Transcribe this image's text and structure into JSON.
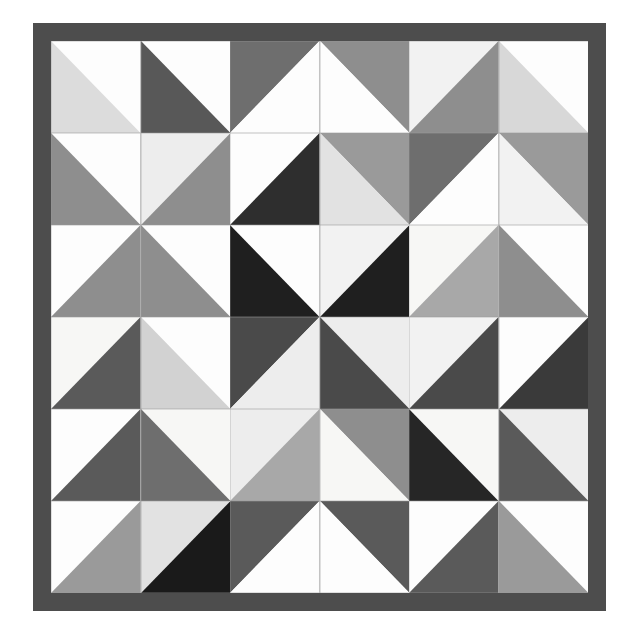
{
  "artwork": {
    "name": "half-square-triangle-quilt",
    "type": "geometric-quilt-pattern",
    "canvas_width": 636,
    "canvas_height": 644,
    "background_color": "#ffffff"
  },
  "frame": {
    "name": "quilt-border",
    "border_color": "#4d4d4d",
    "border_width": 18,
    "left": 33,
    "top": 23,
    "width": 573,
    "height": 588
  },
  "grid": {
    "rows": 6,
    "cols": 6,
    "cell_width": 92.5,
    "cell_height": 95.0,
    "seam_color": "#9c9c9c",
    "seam_width": 0.8
  },
  "palette": {
    "white": "#fdfdfd",
    "offwhite": "#f7f7f5",
    "lightest": "#eeeeee",
    "light": "#e2e2e2",
    "light_gray": "#d8d8d8",
    "mid_light": "#c4c4c4",
    "mid": "#a8a8a8",
    "mid_gray": "#9a9a9a",
    "steel": "#8e8e8e",
    "dark_gray": "#6e6e6e",
    "dark": "#5a5a5a",
    "darker": "#4a4a4a",
    "charcoal": "#3a3a3a",
    "near_black": "#262626",
    "black": "#1a1a1a"
  },
  "chart_data": {
    "type": "heatmap",
    "rows": 6,
    "cols": 6,
    "diagonal_legend": {
      "nwse": "diagonal runs from top-left corner to bottom-right corner; triangle A is upper-right, triangle B is lower-left",
      "nesw": "diagonal runs from top-right corner to bottom-left corner; triangle A is upper-left, triangle B is lower-right"
    },
    "cells": [
      [
        {
          "r": 1,
          "c": 1,
          "diag": "nwse",
          "a": "#fdfdfd",
          "b": "#dcdcdc"
        },
        {
          "r": 1,
          "c": 2,
          "diag": "nwse",
          "a": "#fdfdfd",
          "b": "#585858"
        },
        {
          "r": 1,
          "c": 3,
          "diag": "nesw",
          "a": "#6e6e6e",
          "b": "#fdfdfd"
        },
        {
          "r": 1,
          "c": 4,
          "diag": "nwse",
          "a": "#8e8e8e",
          "b": "#fdfdfd"
        },
        {
          "r": 1,
          "c": 5,
          "diag": "nesw",
          "a": "#f2f2f2",
          "b": "#8e8e8e"
        },
        {
          "r": 1,
          "c": 6,
          "diag": "nwse",
          "a": "#fdfdfd",
          "b": "#d8d8d8"
        }
      ],
      [
        {
          "r": 2,
          "c": 1,
          "diag": "nwse",
          "a": "#fdfdfd",
          "b": "#8e8e8e"
        },
        {
          "r": 2,
          "c": 2,
          "diag": "nesw",
          "a": "#ededed",
          "b": "#8e8e8e"
        },
        {
          "r": 2,
          "c": 3,
          "diag": "nesw",
          "a": "#fdfdfd",
          "b": "#2e2e2e"
        },
        {
          "r": 2,
          "c": 4,
          "diag": "nwse",
          "a": "#9a9a9a",
          "b": "#e2e2e2"
        },
        {
          "r": 2,
          "c": 5,
          "diag": "nesw",
          "a": "#6e6e6e",
          "b": "#fdfdfd"
        },
        {
          "r": 2,
          "c": 6,
          "diag": "nwse",
          "a": "#9a9a9a",
          "b": "#f2f2f2"
        }
      ],
      [
        {
          "r": 3,
          "c": 1,
          "diag": "nesw",
          "a": "#fdfdfd",
          "b": "#8e8e8e"
        },
        {
          "r": 3,
          "c": 2,
          "diag": "nwse",
          "a": "#fdfdfd",
          "b": "#8e8e8e"
        },
        {
          "r": 3,
          "c": 3,
          "diag": "nwse",
          "a": "#fdfdfd",
          "b": "#1f1f1f"
        },
        {
          "r": 3,
          "c": 4,
          "diag": "nesw",
          "a": "#f2f2f2",
          "b": "#1f1f1f"
        },
        {
          "r": 3,
          "c": 5,
          "diag": "nesw",
          "a": "#f7f7f5",
          "b": "#a8a8a8"
        },
        {
          "r": 3,
          "c": 6,
          "diag": "nwse",
          "a": "#fdfdfd",
          "b": "#8e8e8e"
        }
      ],
      [
        {
          "r": 4,
          "c": 1,
          "diag": "nesw",
          "a": "#f7f7f5",
          "b": "#5a5a5a"
        },
        {
          "r": 4,
          "c": 2,
          "diag": "nwse",
          "a": "#fdfdfd",
          "b": "#d2d2d2"
        },
        {
          "r": 4,
          "c": 3,
          "diag": "nesw",
          "a": "#4a4a4a",
          "b": "#ededed"
        },
        {
          "r": 4,
          "c": 4,
          "diag": "nwse",
          "a": "#ededed",
          "b": "#4a4a4a"
        },
        {
          "r": 4,
          "c": 5,
          "diag": "nesw",
          "a": "#f2f2f2",
          "b": "#4a4a4a"
        },
        {
          "r": 4,
          "c": 6,
          "diag": "nesw",
          "a": "#fdfdfd",
          "b": "#3a3a3a"
        }
      ],
      [
        {
          "r": 5,
          "c": 1,
          "diag": "nesw",
          "a": "#fdfdfd",
          "b": "#5a5a5a"
        },
        {
          "r": 5,
          "c": 2,
          "diag": "nwse",
          "a": "#f7f7f5",
          "b": "#6e6e6e"
        },
        {
          "r": 5,
          "c": 3,
          "diag": "nesw",
          "a": "#ededed",
          "b": "#a8a8a8"
        },
        {
          "r": 5,
          "c": 4,
          "diag": "nwse",
          "a": "#8e8e8e",
          "b": "#f7f7f5"
        },
        {
          "r": 5,
          "c": 5,
          "diag": "nwse",
          "a": "#f7f7f5",
          "b": "#262626"
        },
        {
          "r": 5,
          "c": 6,
          "diag": "nwse",
          "a": "#ededed",
          "b": "#5a5a5a"
        }
      ],
      [
        {
          "r": 6,
          "c": 1,
          "diag": "nesw",
          "a": "#fdfdfd",
          "b": "#9a9a9a"
        },
        {
          "r": 6,
          "c": 2,
          "diag": "nesw",
          "a": "#e2e2e2",
          "b": "#1a1a1a"
        },
        {
          "r": 6,
          "c": 3,
          "diag": "nesw",
          "a": "#5a5a5a",
          "b": "#fdfdfd"
        },
        {
          "r": 6,
          "c": 4,
          "diag": "nwse",
          "a": "#5a5a5a",
          "b": "#fdfdfd"
        },
        {
          "r": 6,
          "c": 5,
          "diag": "nesw",
          "a": "#fdfdfd",
          "b": "#5a5a5a"
        },
        {
          "r": 6,
          "c": 6,
          "diag": "nwse",
          "a": "#fdfdfd",
          "b": "#9a9a9a"
        }
      ]
    ]
  }
}
